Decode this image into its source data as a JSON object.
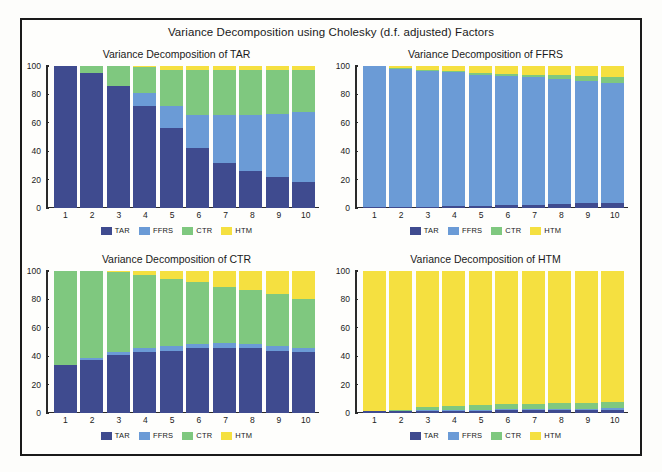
{
  "figure": {
    "title": "Variance Decomposition using Cholesky (d.f. adjusted) Factors",
    "colors": {
      "TAR": "#3f4b8f",
      "FFRS": "#6b9bd6",
      "CTR": "#7fc87f",
      "HTM": "#f5e040",
      "frame": "#1a1a1a",
      "axis": "#2a2a2a",
      "background": "#fefefc"
    }
  },
  "legend": {
    "position": "bottom-center",
    "entries": [
      {
        "label": "TAR",
        "color": "#3f4b8f"
      },
      {
        "label": "FFRS",
        "color": "#6b9bd6"
      },
      {
        "label": "CTR",
        "color": "#7fc87f"
      },
      {
        "label": "HTM",
        "color": "#f5e040"
      }
    ]
  },
  "chart_data": [
    {
      "type": "bar",
      "stacked": true,
      "title": "Variance Decomposition of TAR",
      "xlabel": "",
      "ylabel": "",
      "ylim": [
        0,
        100
      ],
      "yticks": [
        0,
        20,
        40,
        60,
        80,
        100
      ],
      "grid": false,
      "categories": [
        "1",
        "2",
        "3",
        "4",
        "5",
        "6",
        "7",
        "8",
        "9",
        "10"
      ],
      "series": [
        {
          "name": "TAR",
          "color": "#3f4b8f",
          "values": [
            100.0,
            94.8,
            85.6,
            71.5,
            56.0,
            42.5,
            32.0,
            26.0,
            21.5,
            18.5
          ]
        },
        {
          "name": "FFRS",
          "color": "#6b9bd6",
          "values": [
            0.0,
            0.2,
            0.4,
            9.5,
            16.0,
            23.0,
            33.5,
            39.5,
            45.0,
            49.0
          ]
        },
        {
          "name": "CTR",
          "color": "#7fc87f",
          "values": [
            0.0,
            5.0,
            14.0,
            18.0,
            25.0,
            31.5,
            31.5,
            31.5,
            30.5,
            29.5
          ]
        },
        {
          "name": "HTM",
          "color": "#f5e040",
          "values": [
            0.0,
            0.0,
            0.0,
            1.0,
            3.0,
            3.0,
            3.0,
            3.0,
            3.0,
            3.0
          ]
        }
      ]
    },
    {
      "type": "bar",
      "stacked": true,
      "title": "Variance Decomposition of FFRS",
      "xlabel": "",
      "ylabel": "",
      "ylim": [
        0,
        100
      ],
      "yticks": [
        0,
        20,
        40,
        60,
        80,
        100
      ],
      "grid": false,
      "categories": [
        "1",
        "2",
        "3",
        "4",
        "5",
        "6",
        "7",
        "8",
        "9",
        "10"
      ],
      "series": [
        {
          "name": "TAR",
          "color": "#3f4b8f",
          "values": [
            0.5,
            0.7,
            1.0,
            1.3,
            1.6,
            1.8,
            2.2,
            2.6,
            3.2,
            3.6
          ]
        },
        {
          "name": "FFRS",
          "color": "#6b9bd6",
          "values": [
            99.5,
            97.3,
            95.5,
            94.2,
            92.4,
            91.2,
            89.8,
            88.4,
            86.3,
            84.4
          ]
        },
        {
          "name": "CTR",
          "color": "#7fc87f",
          "values": [
            0.0,
            0.5,
            0.8,
            1.0,
            1.3,
            1.5,
            2.0,
            2.5,
            3.5,
            4.5
          ]
        },
        {
          "name": "HTM",
          "color": "#f5e040",
          "values": [
            0.0,
            1.5,
            2.7,
            3.5,
            4.7,
            5.5,
            6.0,
            6.5,
            7.0,
            7.5
          ]
        }
      ]
    },
    {
      "type": "bar",
      "stacked": true,
      "title": "Variance Decomposition of CTR",
      "xlabel": "",
      "ylabel": "",
      "ylim": [
        0,
        100
      ],
      "yticks": [
        0,
        20,
        40,
        60,
        80,
        100
      ],
      "grid": false,
      "categories": [
        "1",
        "2",
        "3",
        "4",
        "5",
        "6",
        "7",
        "8",
        "9",
        "10"
      ],
      "series": [
        {
          "name": "TAR",
          "color": "#3f4b8f",
          "values": [
            33.5,
            37.5,
            41.0,
            43.0,
            44.0,
            45.5,
            46.0,
            45.5,
            44.0,
            43.0
          ]
        },
        {
          "name": "FFRS",
          "color": "#6b9bd6",
          "values": [
            0.0,
            1.5,
            1.8,
            2.5,
            3.0,
            3.0,
            3.0,
            3.0,
            3.0,
            3.0
          ]
        },
        {
          "name": "CTR",
          "color": "#7fc87f",
          "values": [
            66.5,
            61.0,
            56.2,
            52.0,
            47.5,
            43.5,
            40.0,
            38.0,
            36.5,
            34.0
          ]
        },
        {
          "name": "HTM",
          "color": "#f5e040",
          "values": [
            0.0,
            0.0,
            1.0,
            2.5,
            5.5,
            8.0,
            11.0,
            13.5,
            16.5,
            20.0
          ]
        }
      ]
    },
    {
      "type": "bar",
      "stacked": true,
      "title": "Variance Decomposition of HTM",
      "xlabel": "",
      "ylabel": "",
      "ylim": [
        0,
        100
      ],
      "yticks": [
        0,
        20,
        40,
        60,
        80,
        100
      ],
      "grid": false,
      "categories": [
        "1",
        "2",
        "3",
        "4",
        "5",
        "6",
        "7",
        "8",
        "9",
        "10"
      ],
      "series": [
        {
          "name": "TAR",
          "color": "#3f4b8f",
          "values": [
            1.2,
            1.3,
            1.4,
            1.5,
            1.6,
            1.8,
            1.9,
            2.0,
            2.1,
            2.2
          ]
        },
        {
          "name": "FFRS",
          "color": "#6b9bd6",
          "values": [
            0.0,
            0.2,
            0.4,
            0.5,
            0.6,
            0.7,
            0.8,
            0.9,
            1.0,
            1.1
          ]
        },
        {
          "name": "CTR",
          "color": "#7fc87f",
          "values": [
            0.0,
            0.5,
            2.2,
            2.8,
            3.2,
            3.6,
            3.8,
            4.0,
            4.2,
            4.4
          ]
        },
        {
          "name": "HTM",
          "color": "#f5e040",
          "values": [
            98.8,
            98.0,
            96.0,
            95.2,
            94.6,
            93.9,
            93.5,
            93.1,
            92.7,
            92.3
          ]
        }
      ]
    }
  ]
}
